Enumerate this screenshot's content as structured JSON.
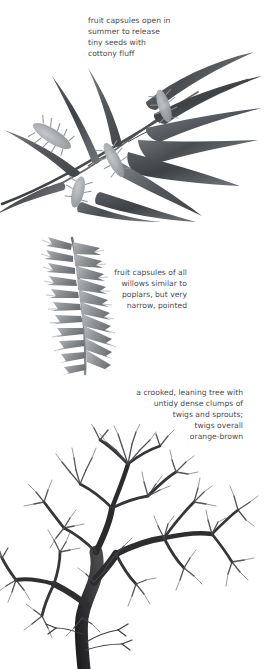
{
  "page": {
    "background_color": "#ffffff",
    "text_color": "#4b4b4f"
  },
  "annotations": {
    "capsules": {
      "text": "fruit capsules open in\nsummer to release\ntiny seeds with\ncottony fluff",
      "align": "left",
      "lines": [
        "fruit capsules open in",
        "summer to release",
        "tiny seeds with",
        "cottony fluff"
      ]
    },
    "narrow": {
      "text": "fruit capsules of all\nwillows similar to\npoplars, but very\nnarrow, pointed",
      "align": "right",
      "lines": [
        "fruit capsules of all",
        "willows similar to",
        "poplars, but very",
        "narrow, pointed"
      ]
    },
    "crooked": {
      "text": "a crooked, leaning tree with\nuntidy dense clumps of\ntwigs and sprouts;\ntwigs overall\norange-brown",
      "align": "right",
      "lines": [
        "a crooked, leaning tree with",
        "untidy dense clumps of",
        "twigs and sprouts;",
        "twigs overall",
        "orange-brown"
      ]
    }
  },
  "illustrations": {
    "branch": {
      "name": "willow branch with leaves and seed capsules",
      "style": "grayscale watercolor",
      "leaf_color": "#55585a",
      "catkin_color": "#a9adaf"
    },
    "catkin": {
      "name": "willow fruiting catkin close-up",
      "style": "grayscale watercolor",
      "color": "#8e9295"
    },
    "tree": {
      "name": "bare crooked willow tree in winter",
      "style": "grayscale ink",
      "trunk_color": "#2b2b2d",
      "twig_color": "#4d4d50"
    }
  }
}
